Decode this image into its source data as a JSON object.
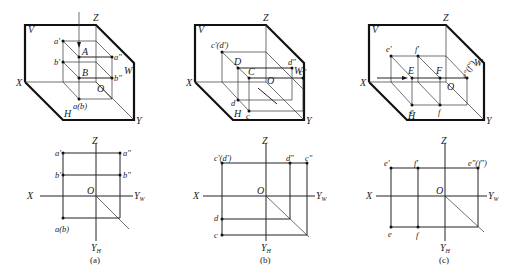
{
  "figure": {
    "panels": [
      {
        "id": "a",
        "caption": "(a)",
        "pictorial": {
          "plane_labels": {
            "V": "V",
            "W": "W",
            "H": "H",
            "X": "X",
            "Y": "Y",
            "Z": "Z",
            "O": "O"
          },
          "points": {
            "A": "A",
            "B": "B",
            "a_v": "a'",
            "b_v": "b'",
            "a_w": "a\"",
            "b_w": "b\"",
            "ab_h": "a(b)"
          }
        },
        "orthographic": {
          "axis_labels": {
            "Z": "Z",
            "X": "X",
            "O": "O",
            "YW": "Y",
            "YW_sub": "W",
            "YH": "Y",
            "YH_sub": "H"
          },
          "points": {
            "a_v": "a'",
            "a_w": "a\"",
            "b_v": "b'",
            "b_w": "b\"",
            "ab_h": "a(b)"
          }
        }
      },
      {
        "id": "b",
        "caption": "(b)",
        "pictorial": {
          "plane_labels": {
            "V": "V",
            "W": "W",
            "H": "H",
            "X": "X",
            "Y": "Y",
            "Z": "Z",
            "O": "O"
          },
          "points": {
            "C": "C",
            "D": "D",
            "cd_v": "c'(d')",
            "d_w": "d\"",
            "c_w": "c\"",
            "d_h": "d",
            "c_h": "c"
          }
        },
        "orthographic": {
          "axis_labels": {
            "Z": "Z",
            "X": "X",
            "O": "O",
            "YW": "Y",
            "YW_sub": "W",
            "YH": "Y",
            "YH_sub": "H"
          },
          "points": {
            "cd_v": "c'(d')",
            "d_w": "d\"",
            "c_w": "c\"",
            "d_h": "d",
            "c_h": "c"
          }
        }
      },
      {
        "id": "c",
        "caption": "(c)",
        "pictorial": {
          "plane_labels": {
            "V": "V",
            "W": "W",
            "H": "H",
            "X": "X",
            "Y": "Y",
            "Z": "Z",
            "O": "O"
          },
          "points": {
            "E": "E",
            "F": "F",
            "e_v": "e'",
            "f_v": "f'",
            "ef_w": "e\"(f\")",
            "e_h": "e",
            "f_h": "f"
          }
        },
        "orthographic": {
          "axis_labels": {
            "Z": "Z",
            "X": "X",
            "O": "O",
            "YW": "Y",
            "YW_sub": "W",
            "YH": "Y",
            "YH_sub": "H"
          },
          "points": {
            "e_v": "e'",
            "f_v": "f'",
            "ef_w": "e\"(f\")",
            "e_h": "e",
            "f_h": "f"
          }
        }
      }
    ]
  }
}
